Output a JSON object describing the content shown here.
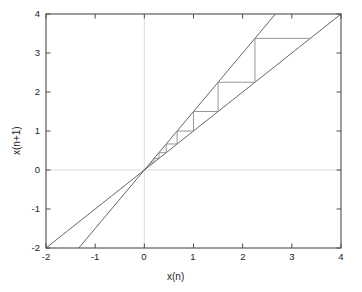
{
  "chart_data": {
    "type": "line",
    "title": "",
    "subtitle": "",
    "xlabel": "x(n)",
    "ylabel": "x(n+1)",
    "xlim": [
      -2,
      4
    ],
    "ylim": [
      -2,
      4
    ],
    "xticks": [
      -2,
      -1,
      0,
      1,
      2,
      3,
      4
    ],
    "yticks": [
      -2,
      -1,
      0,
      1,
      2,
      3,
      4
    ],
    "xtick_labels": [
      "-2",
      "-1",
      "0",
      "1",
      "2",
      "3",
      "4"
    ],
    "ytick_labels": [
      "-2",
      "-1",
      "0",
      "1",
      "2",
      "3",
      "4"
    ],
    "grid": false,
    "zero_lines": true,
    "legend": null,
    "box": true,
    "series": [
      {
        "name": "identity-line",
        "description": "y = x",
        "type": "line",
        "slope": 1,
        "intercept": 0,
        "color": "#555555",
        "points": [
          [
            -2,
            -2
          ],
          [
            4,
            4
          ]
        ]
      },
      {
        "name": "map-line",
        "description": "y = 1.5x",
        "type": "line",
        "slope": 1.5,
        "intercept": 0,
        "color": "#555555",
        "points": [
          [
            -1.3333,
            -2
          ],
          [
            2.6667,
            4
          ]
        ]
      },
      {
        "name": "cobweb-staircase",
        "description": "cobweb iteration of x(n+1) = 1.5 x(n)",
        "type": "line",
        "color": "#8a8a8a",
        "iterates": [
          0.0878,
          0.1317,
          0.1975,
          0.2963,
          0.4444,
          0.6667,
          1.0,
          1.5,
          2.25,
          3.375
        ],
        "points": [
          [
            0.0878,
            0.0878
          ],
          [
            0.0878,
            0.1317
          ],
          [
            0.1317,
            0.1317
          ],
          [
            0.1317,
            0.1975
          ],
          [
            0.1975,
            0.1975
          ],
          [
            0.1975,
            0.2963
          ],
          [
            0.2963,
            0.2963
          ],
          [
            0.2963,
            0.4444
          ],
          [
            0.4444,
            0.4444
          ],
          [
            0.4444,
            0.6667
          ],
          [
            0.6667,
            0.6667
          ],
          [
            0.6667,
            1.0
          ],
          [
            1.0,
            1.0
          ],
          [
            1.0,
            1.5
          ],
          [
            1.5,
            1.5
          ],
          [
            1.5,
            2.25
          ],
          [
            2.25,
            2.25
          ],
          [
            2.25,
            3.375
          ],
          [
            3.375,
            3.375
          ]
        ]
      }
    ],
    "colors": {
      "axis": "#4d4d4d",
      "line": "#555555",
      "cobweb": "#8a8a8a",
      "zero_line": "#d9d9d9",
      "background": "#ffffff",
      "text": "#1c1c1c"
    }
  }
}
